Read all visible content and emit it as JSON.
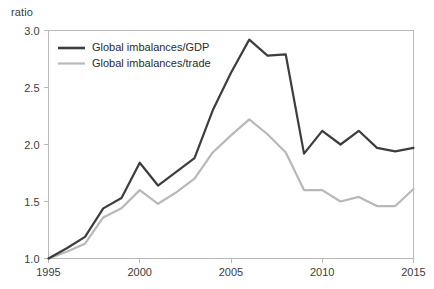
{
  "chart_data": {
    "type": "line",
    "title": "",
    "subtitle": "",
    "xlabel": "",
    "ylabel": "ratio",
    "ylabel_position": "top-left",
    "grid": false,
    "legend_position": "top-left-inside",
    "xlim": [
      1995,
      2015
    ],
    "ylim": [
      1.0,
      3.0
    ],
    "xticks": [
      1995,
      2000,
      2005,
      2010,
      2015
    ],
    "xtick_labels": [
      "1995",
      "2000",
      "2005",
      "2010",
      "2015"
    ],
    "yticks": [
      1.0,
      1.5,
      2.0,
      2.5,
      3.0
    ],
    "ytick_labels": [
      "1.0",
      "1.5",
      "2.0",
      "2.5",
      "3.0"
    ],
    "x": [
      1995,
      1996,
      1997,
      1998,
      1999,
      2000,
      2001,
      2002,
      2003,
      2004,
      2005,
      2006,
      2007,
      2008,
      2009,
      2010,
      2011,
      2012,
      2013,
      2014,
      2015
    ],
    "series": [
      {
        "name": "Global imbalances/GDP",
        "color": "#3d3d3d",
        "width": 2.2,
        "values": [
          1.0,
          1.09,
          1.19,
          1.44,
          1.53,
          1.84,
          1.64,
          1.76,
          1.88,
          2.3,
          2.63,
          2.92,
          2.78,
          2.79,
          1.92,
          2.12,
          2.0,
          2.12,
          1.97,
          1.94,
          1.97
        ]
      },
      {
        "name": "Global imbalances/trade",
        "color": "#b8b8b8",
        "width": 2.2,
        "values": [
          1.0,
          1.06,
          1.13,
          1.36,
          1.44,
          1.6,
          1.48,
          1.58,
          1.7,
          1.93,
          2.08,
          2.22,
          2.09,
          1.93,
          1.6,
          1.6,
          1.5,
          1.54,
          1.46,
          1.46,
          1.61
        ]
      }
    ],
    "annotations": []
  },
  "legend": {
    "items": [
      {
        "label": "Global imbalances/GDP",
        "color": "#3d3d3d"
      },
      {
        "label": "Global imbalances/trade",
        "color": "#b8b8b8"
      }
    ]
  },
  "axis": {
    "unit_label": "ratio"
  }
}
